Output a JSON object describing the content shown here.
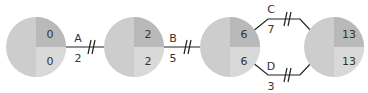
{
  "diagram": {
    "type": "activity-network",
    "colors": {
      "node_left": "#cdcdcd",
      "node_top_right": "#b9b9b9",
      "node_bottom_right": "#d9d9d9",
      "line": "#222222",
      "text": "#333333"
    },
    "nodes": [
      {
        "id": "n1",
        "cx": 36,
        "cy": 47,
        "r": 30,
        "early": "0",
        "late": "0"
      },
      {
        "id": "n2",
        "cx": 134,
        "cy": 47,
        "r": 30,
        "early": "2",
        "late": "2"
      },
      {
        "id": "n3",
        "cx": 230,
        "cy": 47,
        "r": 30,
        "early": "6",
        "late": "6"
      },
      {
        "id": "n4",
        "cx": 334,
        "cy": 47,
        "r": 30,
        "early": "13",
        "late": "13"
      }
    ],
    "edges": [
      {
        "id": "A",
        "label": "A",
        "duration": "2",
        "from": "n1",
        "to": "n2",
        "critical": true
      },
      {
        "id": "B",
        "label": "B",
        "duration": "5",
        "from": "n2",
        "to": "n3",
        "critical": true
      },
      {
        "id": "C",
        "label": "C",
        "duration": "7",
        "from": "n3",
        "to": "n4",
        "critical": true
      },
      {
        "id": "D",
        "label": "D",
        "duration": "3",
        "from": "n3",
        "to": "n4",
        "critical": true
      }
    ]
  }
}
